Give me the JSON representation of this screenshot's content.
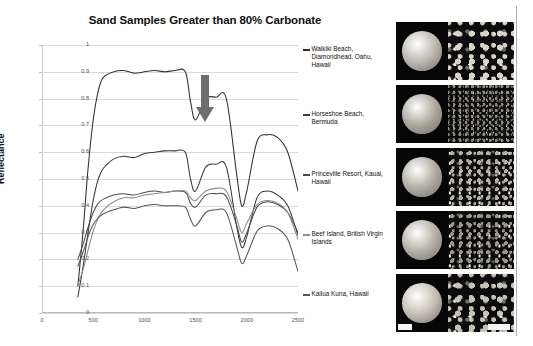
{
  "title": "Sand Samples Greater than 80% Carbonate",
  "axes": {
    "ylabel": "Reflectance",
    "xlabel": "",
    "yticks": [
      "0",
      "0.1",
      "0.2",
      "0.3",
      "0.4",
      "0.5",
      "0.6",
      "0.7",
      "0.8",
      "0.9",
      "1"
    ],
    "xticks": [
      "0",
      "500",
      "1000",
      "1500",
      "2000",
      "2500"
    ]
  },
  "annotation": {
    "arrow_name": "down-arrow-annotation",
    "arrow_color": "#6e6e6e"
  },
  "legend": [
    {
      "label": "Waikiki Beach, Diamondhead, Oahu, Hawaii",
      "color": "#2f2f2f"
    },
    {
      "label": "Horseshoe Beach, Bermuda",
      "color": "#3a3a3a"
    },
    {
      "label": "Princeville Resort, Kauai, Hawaii",
      "color": "#4a4a4a"
    },
    {
      "label": "Beef Island, British Virgin Islands",
      "color": "#8d8d8d"
    },
    {
      "label": "Kailua Kuna, Hawaii",
      "color": "#555555"
    }
  ],
  "samples": [
    {
      "name": "Waikiki Beach, Diamondhead, Oahu, Hawaii",
      "dish_tone": "#b9b5ab",
      "grain_tone": "#d8d4c8",
      "grain_scale": "coarse"
    },
    {
      "name": "Horseshoe Beach, Bermuda",
      "dish_tone": "#a8a49a",
      "grain_tone": "#8e8a80",
      "grain_scale": "fine"
    },
    {
      "name": "Princeville Resort, Kauai, Hawaii",
      "dish_tone": "#aeaaa0",
      "grain_tone": "#b4b0a4",
      "grain_scale": "medium"
    },
    {
      "name": "Beef Island, British Virgin Islands",
      "dish_tone": "#b2aea4",
      "grain_tone": "#9b978c",
      "grain_scale": "medium"
    },
    {
      "name": "Kailua Kuna, Hawaii",
      "dish_tone": "#c2bdb2",
      "grain_tone": "#c6c2b6",
      "grain_scale": "coarse"
    }
  ],
  "chart_data": {
    "type": "line",
    "title": "Sand Samples Greater than 80% Carbonate",
    "xlabel": "",
    "ylabel": "Reflectance",
    "xlim": [
      0,
      2500
    ],
    "ylim": [
      0,
      1
    ],
    "grid": true,
    "legend_position": "right",
    "annotations": [
      {
        "type": "arrow",
        "direction": "down",
        "x": 1450,
        "y": 0.93,
        "note": "carbonate absorption feature near 1450 nm"
      }
    ],
    "x": [
      350,
      400,
      450,
      500,
      550,
      600,
      700,
      800,
      900,
      1000,
      1100,
      1200,
      1300,
      1400,
      1450,
      1500,
      1600,
      1700,
      1800,
      1900,
      1950,
      2000,
      2100,
      2200,
      2300,
      2400,
      2500
    ],
    "series": [
      {
        "name": "Waikiki Beach, Diamondhead, Oahu, Hawaii",
        "color": "#2f2f2f",
        "values": [
          0.1,
          0.3,
          0.54,
          0.72,
          0.83,
          0.88,
          0.9,
          0.905,
          0.895,
          0.9,
          0.905,
          0.9,
          0.905,
          0.9,
          0.79,
          0.72,
          0.8,
          0.805,
          0.8,
          0.52,
          0.4,
          0.455,
          0.64,
          0.665,
          0.655,
          0.6,
          0.455
        ]
      },
      {
        "name": "Horseshoe Beach, Bermuda",
        "color": "#3a3a3a",
        "values": [
          0.06,
          0.17,
          0.3,
          0.42,
          0.5,
          0.54,
          0.575,
          0.585,
          0.58,
          0.595,
          0.6,
          0.605,
          0.605,
          0.6,
          0.5,
          0.455,
          0.545,
          0.555,
          0.545,
          0.325,
          0.245,
          0.285,
          0.43,
          0.455,
          0.44,
          0.4,
          0.29
        ]
      },
      {
        "name": "Princeville Resort, Kauai, Hawaii",
        "color": "#4a4a4a",
        "values": [
          0.2,
          0.255,
          0.32,
          0.375,
          0.41,
          0.425,
          0.44,
          0.445,
          0.44,
          0.45,
          0.455,
          0.45,
          0.455,
          0.45,
          0.41,
          0.395,
          0.44,
          0.445,
          0.435,
          0.33,
          0.265,
          0.3,
          0.395,
          0.415,
          0.405,
          0.375,
          0.3
        ]
      },
      {
        "name": "Beef Island, British Virgin Islands",
        "color": "#8d8d8d",
        "values": [
          0.105,
          0.16,
          0.235,
          0.305,
          0.355,
          0.385,
          0.415,
          0.43,
          0.43,
          0.44,
          0.445,
          0.45,
          0.455,
          0.455,
          0.43,
          0.42,
          0.455,
          0.465,
          0.455,
          0.355,
          0.3,
          0.335,
          0.405,
          0.42,
          0.41,
          0.375,
          0.275
        ]
      },
      {
        "name": "Kailua Kuna, Hawaii",
        "color": "#555555",
        "values": [
          0.175,
          0.225,
          0.285,
          0.33,
          0.355,
          0.37,
          0.385,
          0.395,
          0.39,
          0.4,
          0.405,
          0.4,
          0.4,
          0.395,
          0.35,
          0.325,
          0.375,
          0.385,
          0.375,
          0.25,
          0.185,
          0.215,
          0.305,
          0.325,
          0.315,
          0.275,
          0.155
        ]
      }
    ]
  }
}
